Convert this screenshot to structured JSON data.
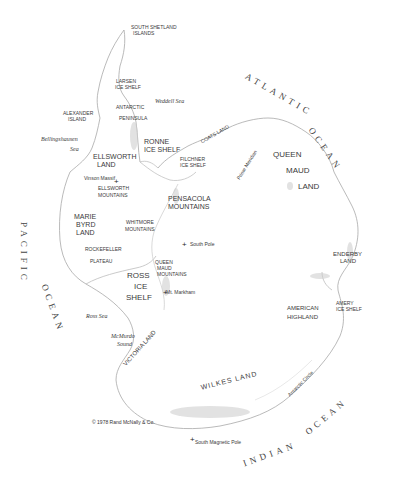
{
  "map": {
    "title": "Antarctica",
    "copyright": "© 1978 Rand McNally & Co.",
    "oceans": {
      "atlantic_1": "ATLANTIC",
      "atlantic_2": "OCEAN",
      "pacific_1": "PACIFIC",
      "pacific_2": "OCEAN",
      "indian_1": "INDIAN",
      "indian_2": "OCEAN"
    },
    "seas": {
      "weddell": "Weddell Sea",
      "bellingshausen_1": "Bellingshausen",
      "bellingshausen_2": "Sea",
      "ross": "Ross Sea",
      "mcmurdo_1": "McMurdo",
      "mcmurdo_2": "Sound"
    },
    "regions": {
      "south_shetland_1": "SOUTH SHETLAND",
      "south_shetland_2": "ISLANDS",
      "larsen_1": "LARSEN",
      "larsen_2": "ICE SHELF",
      "antarctic_pen_1": "ANTARCTIC",
      "antarctic_pen_2": "PENINSULA",
      "alexander_1": "ALEXANDER",
      "alexander_2": "ISLAND",
      "ronne_1": "RONNE",
      "ronne_2": "ICE SHELF",
      "ellsworth_land_1": "ELLSWORTH",
      "ellsworth_land_2": "LAND",
      "coats_land": "COATS LAND",
      "filchner_1": "FILCHNER",
      "filchner_2": "ICE SHELF",
      "queen_maud_land_1": "QUEEN",
      "queen_maud_land_2": "MAUD",
      "queen_maud_land_3": "LAND",
      "ellsworth_mtns_1": "ELLSWORTH",
      "ellsworth_mtns_2": "MOUNTAINS",
      "pensacola_1": "PENSACOLA",
      "pensacola_2": "MOUNTAINS",
      "marie_byrd_1": "MARIE",
      "marie_byrd_2": "BYRD",
      "marie_byrd_3": "LAND",
      "whitmore_1": "WHITMORE",
      "whitmore_2": "MOUNTAINS",
      "rockefeller_1": "ROCKEFELLER",
      "rockefeller_2": "PLATEAU",
      "qm_mountains_1": "QUEEN",
      "qm_mountains_2": "MAUD",
      "qm_mountains_3": "MOUNTAINS",
      "ross_shelf_1": "ROSS",
      "ross_shelf_2": "ICE",
      "ross_shelf_3": "SHELF",
      "victoria_land": "VICTORIA LAND",
      "enderby_1": "ENDERBY",
      "enderby_2": "LAND",
      "amery_1": "AMERY",
      "amery_2": "ICE SHELF",
      "american_highland_1": "AMERICAN",
      "american_highland_2": "HIGHLAND",
      "wilkes_land": "WILKES LAND"
    },
    "lines": {
      "prime_meridian": "Prime Meridian",
      "antarctic_circle": "Antarctic Circle"
    },
    "points": {
      "vinson": "Vinson Massif",
      "south_pole": "South Pole",
      "mt_markham": "Mt. Markham",
      "south_magnetic_pole": "South Magnetic Pole"
    },
    "marker_glyph": "+",
    "colors": {
      "coast": "#9a9a9a",
      "relief": "#bdbdbd",
      "text": "#3a3a3a"
    }
  }
}
